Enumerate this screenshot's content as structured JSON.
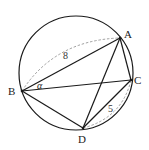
{
  "diagram": {
    "type": "inscribed-quadrilateral-in-circle",
    "circle": {
      "cx": 76,
      "cy": 73,
      "r": 57
    },
    "points": {
      "A": {
        "label": "A",
        "x": 120,
        "y": 38,
        "lx": 124,
        "ly": 38
      },
      "B": {
        "label": "B",
        "x": 22,
        "y": 91,
        "lx": 8,
        "ly": 95
      },
      "C": {
        "label": "C",
        "x": 131,
        "y": 80,
        "lx": 134,
        "ly": 84
      },
      "D": {
        "label": "D",
        "x": 83,
        "y": 128,
        "lx": 78,
        "ly": 143
      }
    },
    "segments": [
      {
        "from": "A",
        "to": "B"
      },
      {
        "from": "A",
        "to": "C"
      },
      {
        "from": "A",
        "to": "D"
      },
      {
        "from": "B",
        "to": "C"
      },
      {
        "from": "B",
        "to": "D"
      },
      {
        "from": "C",
        "to": "D"
      }
    ],
    "measurements": {
      "AB": {
        "label": "8",
        "x": 63,
        "y": 59
      },
      "CD": {
        "label": "5",
        "x": 108,
        "y": 112
      }
    },
    "angle": {
      "label": "α",
      "vertex": "B",
      "x": 37,
      "y": 89
    },
    "colors": {
      "line": "#1a1a1a",
      "dashed": "#888888",
      "text": "#222222"
    }
  }
}
